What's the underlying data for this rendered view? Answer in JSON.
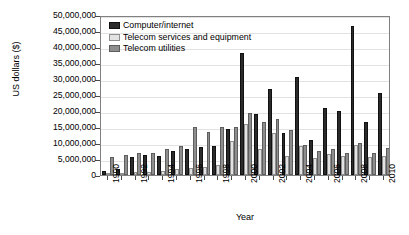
{
  "chart_data": {
    "type": "bar",
    "title": "",
    "xlabel": "Year",
    "ylabel": "US dollars ($)",
    "ylim": [
      0,
      50000000
    ],
    "ytick_step": 5000000,
    "ytick_labels": [
      "50,000,000",
      "45,000,000",
      "40,000,000",
      "35,000,000",
      "30,000,000",
      "25,000,000",
      "20,000,000",
      "15,000,000",
      "10,000,000",
      "5,000,000",
      "0"
    ],
    "ytick_values": [
      50000000,
      45000000,
      40000000,
      35000000,
      30000000,
      25000000,
      20000000,
      15000000,
      10000000,
      5000000,
      0
    ],
    "grid": true,
    "legend_position": "top-left inside plot",
    "categories": [
      1990,
      1991,
      1992,
      1993,
      1994,
      1995,
      1996,
      1997,
      1998,
      1999,
      2000,
      2001,
      2002,
      2003,
      2004,
      2005,
      2006,
      2007,
      2008,
      2009,
      2010
    ],
    "xtick_labels": [
      "1990",
      "1992",
      "1994",
      "1996",
      "1998",
      "2000",
      "2002",
      "2004",
      "2006",
      "2008",
      "2010"
    ],
    "xtick_label_indices": [
      0,
      2,
      4,
      6,
      8,
      10,
      12,
      14,
      16,
      18,
      20
    ],
    "series": [
      {
        "name": "Computer/internet",
        "color": "#2b2b2b",
        "values": [
          1200000,
          1900000,
          5500000,
          6100000,
          6000000,
          7600000,
          8000000,
          8800000,
          9000000,
          14500000,
          38000000,
          19000000,
          27000000,
          13000000,
          30500000,
          11000000,
          21000000,
          20000000,
          46500000,
          16500000,
          25500000
        ]
      },
      {
        "name": "Telecom services and equipment",
        "color": "#e3e3e3",
        "values": [
          600000,
          700000,
          800000,
          900000,
          1300000,
          1800000,
          2200000,
          2600000,
          3000000,
          10500000,
          16000000,
          8200000,
          13000000,
          6000000,
          9000000,
          5200000,
          6500000,
          6000000,
          9500000,
          5500000,
          6000000
        ]
      },
      {
        "name": "Telecom utilities",
        "color": "#8e8e8e",
        "values": [
          5500000,
          6200000,
          6800000,
          7000000,
          8200000,
          9000000,
          15000000,
          13500000,
          15000000,
          15000000,
          19500000,
          16500000,
          17500000,
          14000000,
          9500000,
          7500000,
          8000000,
          7000000,
          10000000,
          7000000,
          8500000
        ]
      }
    ]
  },
  "legend": {
    "items": [
      {
        "label": "Computer/internet"
      },
      {
        "label": "Telecom services and equipment"
      },
      {
        "label": "Telecom utilities"
      }
    ]
  }
}
